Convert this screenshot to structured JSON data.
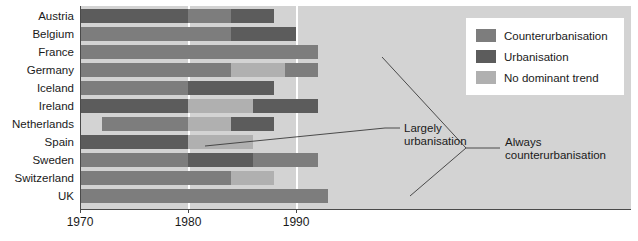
{
  "chart_data": {
    "type": "bar",
    "subtype": "gantt-timeline",
    "title": "",
    "xlabel": "",
    "ylabel": "",
    "xlim": [
      1970,
      2021
    ],
    "xticks": [
      1970,
      1980,
      1990
    ],
    "xtick_labels": [
      "1970",
      "1980",
      "1990"
    ],
    "grid": true,
    "gridlines_at": [
      1980,
      1990
    ],
    "categories": [
      "Austria",
      "Belgium",
      "France",
      "Germany",
      "Iceland",
      "Ireland",
      "Netherlands",
      "Spain",
      "Sweden",
      "Switzerland",
      "UK"
    ],
    "legend_position": "top-right",
    "legend": [
      {
        "label": "Counterurbanisation",
        "color": "#7d7d7d",
        "key": "counter"
      },
      {
        "label": "Urbanisation",
        "color": "#5c5c5c",
        "key": "urban"
      },
      {
        "label": "No dominant trend",
        "color": "#b0b0b0",
        "key": "notrend"
      }
    ],
    "rows": [
      {
        "country": "Austria",
        "segments": [
          {
            "trend": "Urbanisation",
            "key": "urban",
            "start": 1970,
            "end": 1980
          },
          {
            "trend": "Counterurbanisation",
            "key": "counter",
            "start": 1980,
            "end": 1984
          },
          {
            "trend": "Urbanisation",
            "key": "urban",
            "start": 1984,
            "end": 1988
          }
        ]
      },
      {
        "country": "Belgium",
        "segments": [
          {
            "trend": "Counterurbanisation",
            "key": "counter",
            "start": 1970,
            "end": 1984
          },
          {
            "trend": "Urbanisation",
            "key": "urban",
            "start": 1984,
            "end": 1990
          }
        ]
      },
      {
        "country": "France",
        "segments": [
          {
            "trend": "Counterurbanisation",
            "key": "counter",
            "start": 1970,
            "end": 1992
          }
        ]
      },
      {
        "country": "Germany",
        "segments": [
          {
            "trend": "Counterurbanisation",
            "key": "counter",
            "start": 1970,
            "end": 1984
          },
          {
            "trend": "No dominant trend",
            "key": "notrend",
            "start": 1984,
            "end": 1989
          },
          {
            "trend": "Counterurbanisation",
            "key": "counter",
            "start": 1989,
            "end": 1992
          }
        ]
      },
      {
        "country": "Iceland",
        "segments": [
          {
            "trend": "Counterurbanisation",
            "key": "counter",
            "start": 1970,
            "end": 1980
          },
          {
            "trend": "Urbanisation",
            "key": "urban",
            "start": 1980,
            "end": 1988
          }
        ]
      },
      {
        "country": "Ireland",
        "segments": [
          {
            "trend": "Urbanisation",
            "key": "urban",
            "start": 1970,
            "end": 1980
          },
          {
            "trend": "No dominant trend",
            "key": "notrend",
            "start": 1980,
            "end": 1986
          },
          {
            "trend": "Urbanisation",
            "key": "urban",
            "start": 1986,
            "end": 1992
          }
        ]
      },
      {
        "country": "Netherlands",
        "segments": [
          {
            "trend": "Counterurbanisation",
            "key": "counter",
            "start": 1972,
            "end": 1980
          },
          {
            "trend": "No dominant trend",
            "key": "notrend",
            "start": 1980,
            "end": 1984
          },
          {
            "trend": "Urbanisation",
            "key": "urban",
            "start": 1984,
            "end": 1988
          }
        ]
      },
      {
        "country": "Spain",
        "segments": [
          {
            "trend": "Urbanisation",
            "key": "urban",
            "start": 1970,
            "end": 1980
          },
          {
            "trend": "No dominant trend",
            "key": "notrend",
            "start": 1980,
            "end": 1986
          }
        ]
      },
      {
        "country": "Sweden",
        "segments": [
          {
            "trend": "Counterurbanisation",
            "key": "counter",
            "start": 1970,
            "end": 1980
          },
          {
            "trend": "Urbanisation",
            "key": "urban",
            "start": 1980,
            "end": 1986
          },
          {
            "trend": "Counterurbanisation",
            "key": "counter",
            "start": 1986,
            "end": 1992
          }
        ]
      },
      {
        "country": "Switzerland",
        "segments": [
          {
            "trend": "Counterurbanisation",
            "key": "counter",
            "start": 1970,
            "end": 1984
          },
          {
            "trend": "No dominant trend",
            "key": "notrend",
            "start": 1984,
            "end": 1988
          }
        ]
      },
      {
        "country": "UK",
        "segments": [
          {
            "trend": "Counterurbanisation",
            "key": "counter",
            "start": 1970,
            "end": 1993
          }
        ]
      }
    ],
    "annotations": [
      {
        "id": "largely-urbanisation",
        "text": "Largely urbanisation",
        "line1": "Largely",
        "line2": "urbanisation",
        "points_to": [
          "Spain"
        ]
      },
      {
        "id": "always-counterurbanisation",
        "text": "Always counterurbanisation",
        "line1": "Always",
        "line2": "counterurbanisation",
        "points_to": [
          "France",
          "UK"
        ]
      }
    ]
  },
  "colors": {
    "counterurbanisation": "#7d7d7d",
    "urbanisation": "#5c5c5c",
    "no_dominant_trend": "#b0b0b0",
    "plot_background": "#d3d3d3",
    "page_background": "#ffffff",
    "axis": "#4a4a4a",
    "text": "#1a1a1a"
  }
}
